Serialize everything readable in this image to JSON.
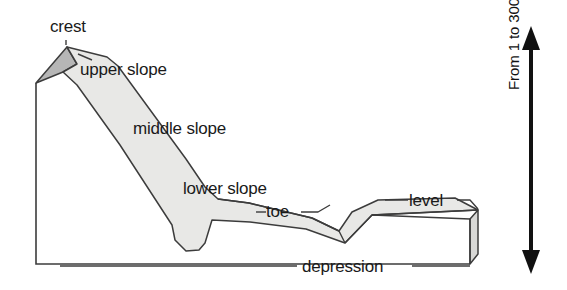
{
  "diagram": {
    "type": "landform-cross-section",
    "labels": {
      "crest": "crest",
      "upper_slope": "upper slope",
      "middle_slope": "middle slope",
      "lower_slope": "lower slope",
      "toe": "toe",
      "depression": "depression",
      "level": "level"
    },
    "scale": {
      "caption": "From 1 to 300 m",
      "arrow": "double-headed-vertical-arrow"
    },
    "colors": {
      "outline": "#3c3c3c",
      "surface_fill": "#e8e8e6",
      "crest_face_fill": "#b9b9b9",
      "block_end_fill": "#d8d8d6",
      "text": "#1a1a1a",
      "background": "#ffffff"
    }
  }
}
